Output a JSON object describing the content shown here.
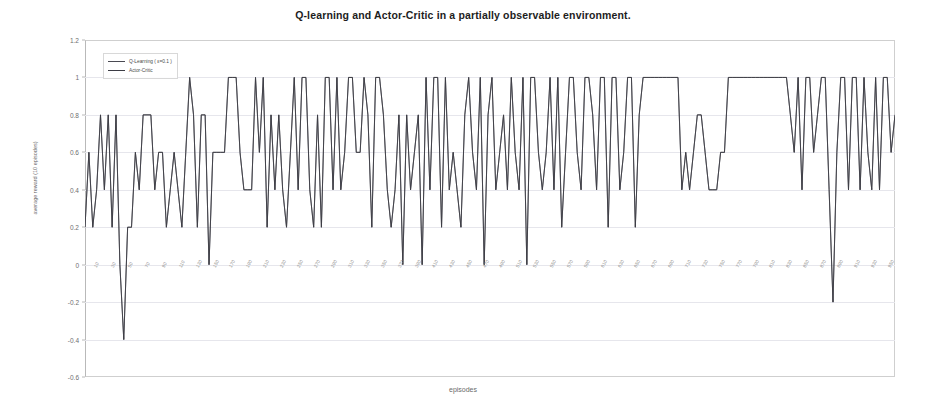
{
  "chart_data": {
    "type": "line",
    "title": "Q-learning and Actor-Critic in a partially observable environment.",
    "xlabel": "episodes",
    "ylabel": "average reward (10 episodes)",
    "ylim": [
      -0.6,
      1.2
    ],
    "yticks": [
      1.2,
      1,
      0.8,
      0.6,
      0.4,
      0.2,
      0,
      -0.2,
      -0.4,
      -0.6
    ],
    "ytick_labels": [
      "1.2",
      "1",
      "0.8",
      "0.6",
      "0.4",
      "0.2",
      "0",
      "-0.2",
      "-0.4",
      "-0.6"
    ],
    "grid": true,
    "legend_position": "top-left",
    "xtick_labels": [
      "10",
      "30",
      "50",
      "70",
      "90",
      "110",
      "130",
      "150",
      "170",
      "190",
      "210",
      "230",
      "250",
      "270",
      "290",
      "310",
      "330",
      "350",
      "370",
      "390",
      "410",
      "430",
      "450",
      "470",
      "490",
      "510",
      "530",
      "550",
      "570",
      "590",
      "610",
      "630",
      "650",
      "670",
      "690",
      "710",
      "730",
      "750",
      "770",
      "790",
      "810",
      "830",
      "850",
      "870",
      "890",
      "910",
      "930",
      "950"
    ],
    "series": [
      {
        "name": "Q-Learning ( ε=0.1 )",
        "color": "#4a4a52",
        "values": [
          0.2,
          0.6,
          0.2,
          0.4,
          0.8,
          0.4,
          0.8,
          0.2,
          0.8,
          0.0,
          -0.4,
          0.2,
          0.2,
          0.6,
          0.4,
          0.8,
          0.8,
          0.8,
          0.4,
          0.6,
          0.6,
          0.2,
          0.4,
          0.6,
          0.4,
          0.2,
          0.6,
          1.0,
          0.8,
          0.2,
          0.8,
          0.8,
          0.0,
          0.6,
          0.6,
          0.6,
          0.6,
          1.0,
          1.0,
          1.0,
          0.6,
          0.4,
          0.4,
          0.4,
          1.0,
          0.6,
          1.0,
          0.2,
          0.8,
          0.4,
          0.8,
          0.4,
          0.2,
          0.6,
          1.0,
          0.4,
          1.0,
          1.0,
          0.4,
          0.2,
          0.8,
          0.2,
          1.0,
          1.0,
          0.4,
          1.0,
          0.4,
          0.6,
          1.0,
          1.0,
          0.6,
          0.6,
          1.0,
          0.8,
          0.2,
          1.0,
          1.0,
          0.8,
          0.4,
          0.2,
          0.4,
          0.8,
          0.0,
          0.8,
          0.4,
          0.6,
          0.8,
          0.0,
          1.0,
          0.4,
          1.0,
          1.0,
          0.2,
          1.0,
          0.4,
          0.6,
          0.4,
          0.2,
          0.8,
          1.0,
          0.6,
          0.4,
          1.0,
          0.0,
          0.8,
          1.0,
          0.4,
          0.6,
          0.8,
          0.4,
          1.0,
          0.6,
          0.4,
          1.0,
          0.0,
          1.0,
          1.0,
          0.6,
          0.4,
          0.6,
          1.0,
          0.4,
          1.0,
          0.2,
          0.6,
          1.0,
          1.0,
          0.6,
          0.4,
          1.0,
          1.0,
          0.8,
          0.4,
          1.0,
          1.0,
          0.2,
          1.0,
          1.0,
          0.4,
          0.6,
          1.0,
          1.0,
          0.2,
          0.8,
          1.0,
          1.0,
          1.0,
          1.0,
          1.0,
          1.0,
          1.0,
          1.0,
          1.0,
          1.0,
          0.4,
          0.6,
          0.4,
          0.6,
          0.8,
          0.8,
          0.6,
          0.4,
          0.4,
          0.4,
          0.6,
          0.6,
          1.0,
          1.0,
          1.0,
          1.0,
          1.0,
          1.0,
          1.0,
          1.0,
          1.0,
          1.0,
          1.0,
          1.0,
          1.0,
          1.0,
          1.0,
          1.0,
          0.8,
          0.6,
          1.0,
          0.4,
          1.0,
          1.0,
          0.6,
          0.8,
          1.0,
          1.0,
          0.4,
          -0.2,
          0.6,
          1.0,
          1.0,
          0.4,
          1.0,
          1.0,
          0.4,
          1.0,
          0.6,
          0.4,
          1.0,
          0.4,
          1.0,
          1.0,
          0.6,
          0.8
        ]
      },
      {
        "name": "Actor-Critic",
        "color": "#3c3c44",
        "values": [
          0.2,
          0.6,
          0.2,
          0.4,
          0.8,
          0.4,
          0.8,
          0.2,
          0.8,
          0.0,
          -0.4,
          0.2,
          0.2,
          0.6,
          0.4,
          0.8,
          0.8,
          0.8,
          0.4,
          0.6,
          0.6,
          0.2,
          0.4,
          0.6,
          0.4,
          0.2,
          0.6,
          1.0,
          0.8,
          0.2,
          0.8,
          0.8,
          0.0,
          0.6,
          0.6,
          0.6,
          0.6,
          1.0,
          1.0,
          1.0,
          0.6,
          0.4,
          0.4,
          0.4,
          1.0,
          0.6,
          1.0,
          0.2,
          0.8,
          0.4,
          0.8,
          0.4,
          0.2,
          0.6,
          1.0,
          0.4,
          1.0,
          1.0,
          0.4,
          0.2,
          0.8,
          0.2,
          1.0,
          1.0,
          0.4,
          1.0,
          0.4,
          0.6,
          1.0,
          1.0,
          0.6,
          0.6,
          1.0,
          0.8,
          0.2,
          1.0,
          1.0,
          0.8,
          0.4,
          0.2,
          0.4,
          0.8,
          0.0,
          0.8,
          0.4,
          0.6,
          0.8,
          0.0,
          1.0,
          0.4,
          1.0,
          1.0,
          0.2,
          1.0,
          0.4,
          0.6,
          0.4,
          0.2,
          0.8,
          1.0,
          0.6,
          0.4,
          1.0,
          0.0,
          0.8,
          1.0,
          0.4,
          0.6,
          0.8,
          0.4,
          1.0,
          0.6,
          0.4,
          1.0,
          0.0,
          1.0,
          1.0,
          0.6,
          0.4,
          0.6,
          1.0,
          0.4,
          1.0,
          0.2,
          0.6,
          1.0,
          1.0,
          0.6,
          0.4,
          1.0,
          1.0,
          0.8,
          0.4,
          1.0,
          1.0,
          0.2,
          1.0,
          1.0,
          0.4,
          0.6,
          1.0,
          1.0,
          0.2,
          0.8,
          1.0,
          1.0,
          1.0,
          1.0,
          1.0,
          1.0,
          1.0,
          1.0,
          1.0,
          1.0,
          0.4,
          0.6,
          0.4,
          0.6,
          0.8,
          0.8,
          0.6,
          0.4,
          0.4,
          0.4,
          0.6,
          0.6,
          1.0,
          1.0,
          1.0,
          1.0,
          1.0,
          1.0,
          1.0,
          1.0,
          1.0,
          1.0,
          1.0,
          1.0,
          1.0,
          1.0,
          1.0,
          1.0,
          0.8,
          0.6,
          1.0,
          0.4,
          1.0,
          1.0,
          0.6,
          0.8,
          1.0,
          1.0,
          0.4,
          -0.2,
          0.6,
          1.0,
          1.0,
          0.4,
          1.0,
          1.0,
          0.4,
          1.0,
          0.6,
          0.4,
          1.0,
          0.4,
          1.0,
          1.0,
          0.6,
          0.8
        ]
      }
    ]
  }
}
